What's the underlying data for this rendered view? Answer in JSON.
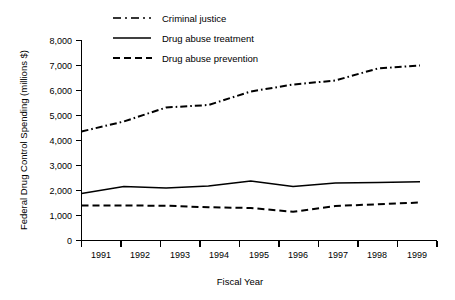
{
  "chart_data": {
    "type": "line",
    "title": "",
    "xlabel": "Fiscal Year",
    "ylabel": "Federal Drug Control Spending (millions $)",
    "categories": [
      "1991",
      "1992",
      "1993",
      "1994",
      "1995",
      "1996",
      "1997",
      "1998",
      "1999"
    ],
    "x": [
      1991,
      1992,
      1993,
      1994,
      1995,
      1996,
      1997,
      1998,
      1999
    ],
    "xlim": [
      1991,
      1999
    ],
    "ylim": [
      0,
      8000
    ],
    "yticks": [
      0,
      1000,
      2000,
      3000,
      4000,
      5000,
      6000,
      7000,
      8000
    ],
    "ytick_labels": [
      "0",
      "1,000",
      "2,000",
      "3,000",
      "4,000",
      "5,000",
      "6,000",
      "7,000",
      "8,000"
    ],
    "grid": false,
    "legend_position": "top-center",
    "series": [
      {
        "name": "Criminal justice",
        "style": "dash-dot",
        "color": "#000000",
        "values": [
          4360,
          4760,
          5320,
          5420,
          5960,
          6240,
          6400,
          6880,
          7000
        ]
      },
      {
        "name": "Drug abuse treatment",
        "style": "solid",
        "color": "#000000",
        "values": [
          1880,
          2160,
          2100,
          2180,
          2380,
          2160,
          2300,
          2320,
          2350
        ]
      },
      {
        "name": "Drug abuse prevention",
        "style": "dashed",
        "color": "#000000",
        "values": [
          1400,
          1400,
          1390,
          1330,
          1300,
          1150,
          1380,
          1450,
          1520
        ]
      }
    ]
  },
  "axes": {
    "y_title": "Federal Drug Control Spending (millions $)",
    "x_title": "Fiscal Year"
  },
  "legend": {
    "items": [
      {
        "label": "Criminal justice"
      },
      {
        "label": "Drug abuse treatment"
      },
      {
        "label": "Drug abuse prevention"
      }
    ]
  },
  "ytick_labels": [
    "8,000",
    "7,000",
    "6,000",
    "5,000",
    "4,000",
    "3,000",
    "2,000",
    "1,000",
    "0"
  ],
  "xtick_labels": [
    "1991",
    "1992",
    "1993",
    "1994",
    "1995",
    "1996",
    "1997",
    "1998",
    "1999"
  ]
}
